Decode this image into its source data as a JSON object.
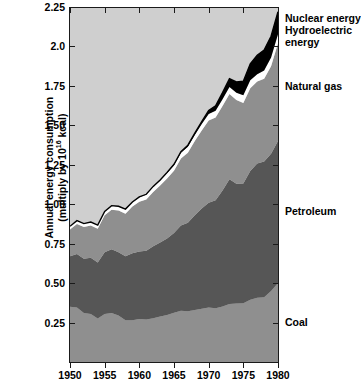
{
  "chart_data": {
    "type": "area",
    "title": "",
    "xlabel": "",
    "ylabel": "Annual energy consumption (multiply by 10^16 kcal)",
    "ylabel_line1": "Annual energy consumption",
    "ylabel_line2": "(multiply by 10",
    "ylabel_exponent": "16",
    "ylabel_line2_end": " kcal)",
    "xlim": [
      1950,
      1980
    ],
    "ylim": [
      0,
      2.25
    ],
    "grid": false,
    "stacked": true,
    "legend_position": "right-inline",
    "xticks": [
      1950,
      1955,
      1960,
      1965,
      1970,
      1975,
      1980
    ],
    "xtick_labels": [
      "1950",
      "1955",
      "1960",
      "1965",
      "1970",
      "1975",
      "1980"
    ],
    "yticks": [
      0.25,
      0.5,
      0.75,
      1.0,
      1.25,
      1.5,
      1.75,
      2.0,
      2.25
    ],
    "ytick_labels": [
      "0.25",
      "0.50",
      "0.75",
      "1.00",
      "1.25",
      "1.50",
      "1.75",
      "2.0",
      "2.25"
    ],
    "x": [
      1950,
      1951,
      1952,
      1953,
      1954,
      1955,
      1956,
      1957,
      1958,
      1959,
      1960,
      1961,
      1962,
      1963,
      1964,
      1965,
      1966,
      1967,
      1968,
      1969,
      1970,
      1971,
      1972,
      1973,
      1974,
      1975,
      1976,
      1977,
      1978,
      1979,
      1980
    ],
    "series": [
      {
        "name": "Coal",
        "color": "#8f8f8f",
        "values": [
          0.35,
          0.345,
          0.31,
          0.305,
          0.275,
          0.305,
          0.31,
          0.295,
          0.265,
          0.265,
          0.272,
          0.27,
          0.278,
          0.288,
          0.298,
          0.312,
          0.325,
          0.322,
          0.33,
          0.338,
          0.345,
          0.34,
          0.352,
          0.368,
          0.37,
          0.372,
          0.395,
          0.408,
          0.41,
          0.45,
          0.5
        ]
      },
      {
        "name": "Petroleum",
        "color": "#565656",
        "values": [
          0.32,
          0.34,
          0.345,
          0.355,
          0.355,
          0.39,
          0.405,
          0.4,
          0.405,
          0.425,
          0.428,
          0.435,
          0.455,
          0.47,
          0.485,
          0.505,
          0.54,
          0.56,
          0.6,
          0.635,
          0.665,
          0.685,
          0.735,
          0.79,
          0.76,
          0.76,
          0.815,
          0.85,
          0.86,
          0.87,
          0.9
        ]
      },
      {
        "name": "Natural gas",
        "color": "#8f8f8f",
        "values": [
          0.17,
          0.19,
          0.2,
          0.205,
          0.215,
          0.235,
          0.25,
          0.265,
          0.27,
          0.295,
          0.315,
          0.325,
          0.345,
          0.36,
          0.38,
          0.395,
          0.425,
          0.445,
          0.47,
          0.495,
          0.52,
          0.525,
          0.535,
          0.54,
          0.53,
          0.51,
          0.525,
          0.52,
          0.525,
          0.555,
          0.62
        ]
      },
      {
        "name": "Hydroelectric energy",
        "color": "#ffffff",
        "values": [
          0.02,
          0.021,
          0.022,
          0.022,
          0.023,
          0.024,
          0.026,
          0.026,
          0.028,
          0.028,
          0.029,
          0.031,
          0.032,
          0.032,
          0.034,
          0.035,
          0.036,
          0.038,
          0.039,
          0.04,
          0.042,
          0.043,
          0.044,
          0.045,
          0.047,
          0.048,
          0.05,
          0.046,
          0.052,
          0.055,
          0.058
        ]
      },
      {
        "name": "Nuclear energy",
        "color": "#000000",
        "values": [
          0.0,
          0.0,
          0.0,
          0.0,
          0.0,
          0.0,
          0.0,
          0.001,
          0.001,
          0.001,
          0.002,
          0.002,
          0.003,
          0.004,
          0.005,
          0.006,
          0.007,
          0.009,
          0.012,
          0.015,
          0.022,
          0.031,
          0.041,
          0.052,
          0.068,
          0.09,
          0.105,
          0.12,
          0.13,
          0.135,
          0.142
        ]
      }
    ],
    "totals": [
      0.86,
      0.896,
      0.877,
      0.887,
      0.868,
      0.954,
      0.991,
      0.987,
      0.969,
      1.014,
      1.046,
      1.063,
      1.113,
      1.154,
      1.202,
      1.253,
      1.333,
      1.374,
      1.451,
      1.523,
      1.594,
      1.624,
      1.707,
      1.795,
      1.775,
      1.78,
      1.89,
      1.944,
      1.977,
      2.065,
      2.22
    ],
    "background_color": "#cfcfcf",
    "outline_color": "#000000"
  },
  "labels": {
    "nuclear": "Nuclear energy",
    "hydro_line1": "Hydroelectric",
    "hydro_line2": "energy",
    "natural_gas": "Natural gas",
    "petroleum": "Petroleum",
    "coal": "Coal"
  }
}
